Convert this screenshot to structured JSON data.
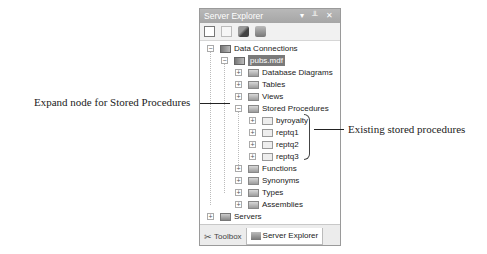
{
  "panel": {
    "title": "Server Explorer",
    "title_controls": "▾ ╨ ✕",
    "toolbar": [
      "refresh-icon",
      "stop-icon",
      "connect-to-database-icon",
      "connect-to-server-icon"
    ]
  },
  "tree": {
    "data_connections": "Data Connections",
    "database": "pubs.mdf",
    "folders": [
      "Database Diagrams",
      "Tables",
      "Views",
      "Stored Procedures"
    ],
    "procedures": [
      "byroyalty",
      "reptq1",
      "reptq2",
      "reptq3"
    ],
    "more_folders": [
      "Functions",
      "Synonyms",
      "Types",
      "Assemblies"
    ],
    "servers": "Servers"
  },
  "tabs": [
    {
      "label": "Toolbox",
      "active": false
    },
    {
      "label": "Server Explorer",
      "active": true
    }
  ],
  "callouts": {
    "left": "Expand node for Stored Procedures",
    "right": "Existing stored procedures"
  }
}
